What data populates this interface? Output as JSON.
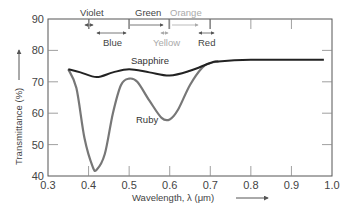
{
  "chart_data": {
    "type": "line",
    "title": "",
    "xlabel": "Wavelength, λ (μm)",
    "ylabel": "Transmittance (%)",
    "xlim": [
      0.3,
      1.0
    ],
    "ylim": [
      40,
      90
    ],
    "xticks": [
      0.3,
      0.4,
      0.5,
      0.6,
      0.7,
      0.8,
      0.9,
      1.0
    ],
    "yticks": [
      40,
      50,
      60,
      70,
      80,
      90
    ],
    "grid": false,
    "legend": "inline labels",
    "series": [
      {
        "name": "Sapphire",
        "color": "#222222",
        "x": [
          0.35,
          0.38,
          0.42,
          0.46,
          0.5,
          0.55,
          0.6,
          0.65,
          0.7,
          0.72,
          0.8,
          0.9,
          0.98
        ],
        "y": [
          74,
          73,
          71.5,
          73,
          74,
          73,
          72,
          73.5,
          76,
          76.5,
          77,
          77,
          77
        ]
      },
      {
        "name": "Ruby",
        "color": "#777777",
        "x": [
          0.35,
          0.37,
          0.39,
          0.41,
          0.42,
          0.44,
          0.46,
          0.48,
          0.5,
          0.52,
          0.55,
          0.58,
          0.6,
          0.62,
          0.65,
          0.68,
          0.7,
          0.72
        ],
        "y": [
          74,
          68,
          52,
          43,
          42,
          47,
          60,
          69,
          71,
          70,
          64,
          58.5,
          58,
          61,
          69,
          74.5,
          76,
          76.5
        ]
      }
    ],
    "color_bands": [
      {
        "name": "Violet",
        "start": 0.39,
        "end": 0.41,
        "row": "top"
      },
      {
        "name": "Blue",
        "start": 0.42,
        "end": 0.49,
        "row": "bottom"
      },
      {
        "name": "Green",
        "start": 0.5,
        "end": 0.58,
        "row": "top"
      },
      {
        "name": "Yellow",
        "start": 0.58,
        "end": 0.59,
        "row": "bottom"
      },
      {
        "name": "Orange",
        "start": 0.6,
        "end": 0.67,
        "row": "top"
      },
      {
        "name": "Red",
        "start": 0.67,
        "end": 0.71,
        "row": "bottom"
      }
    ]
  },
  "labels": {
    "xlabel": "Wavelength, λ (μm)",
    "ylabel": "Transmittance (%)",
    "sapphire": "Sapphire",
    "ruby": "Ruby",
    "violet": "Violet",
    "blue": "Blue",
    "green": "Green",
    "yellow": "Yellow",
    "orange": "Orange",
    "red": "Red"
  }
}
